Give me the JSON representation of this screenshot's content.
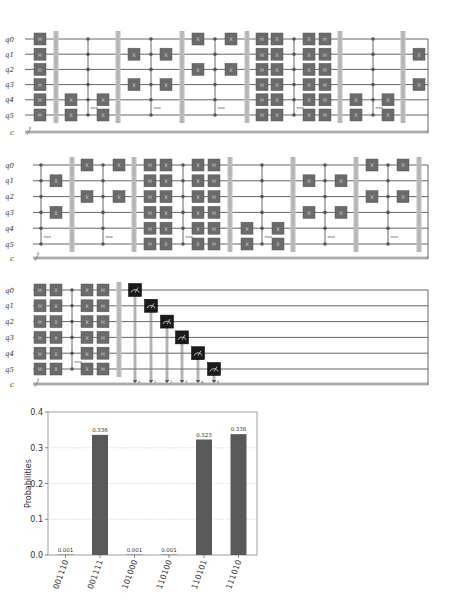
{
  "circuits": [
    {
      "id": "circuit-1",
      "wire_y": [
        39,
        54.2,
        69.4,
        84.6,
        99.8,
        115
      ],
      "c_y": 132,
      "x_start": 25,
      "x_end": 428,
      "qubit_labels": [
        "q0",
        "q1",
        "q2",
        "q3",
        "q4",
        "q5"
      ],
      "classical_label": "c",
      "classical_width": "6",
      "columns": [
        {
          "type": "gate",
          "x": 40,
          "label": "H",
          "qubits": [
            0,
            1,
            2,
            3,
            4,
            5
          ]
        },
        {
          "type": "barrier",
          "x": 56
        },
        {
          "type": "gate",
          "x": 71,
          "label": "X",
          "qubits": [
            4,
            5
          ]
        },
        {
          "type": "mcz",
          "x": 88,
          "label": "mcz"
        },
        {
          "type": "gate",
          "x": 103,
          "label": "X",
          "qubits": [
            4,
            5
          ]
        },
        {
          "type": "barrier",
          "x": 118
        },
        {
          "type": "gate",
          "x": 134,
          "label": "X",
          "qubits": [
            1,
            3
          ]
        },
        {
          "type": "mcz",
          "x": 151,
          "label": "mcz"
        },
        {
          "type": "gate",
          "x": 166,
          "label": "X",
          "qubits": [
            1,
            3
          ]
        },
        {
          "type": "barrier",
          "x": 182
        },
        {
          "type": "gate",
          "x": 198,
          "label": "X",
          "qubits": [
            0,
            2
          ]
        },
        {
          "type": "mcz",
          "x": 215,
          "label": "mcz"
        },
        {
          "type": "gate",
          "x": 231,
          "label": "X",
          "qubits": [
            0,
            2
          ]
        },
        {
          "type": "barrier",
          "x": 247
        },
        {
          "type": "gate",
          "x": 262,
          "label": "H",
          "qubits": [
            0,
            1,
            2,
            3,
            4,
            5
          ]
        },
        {
          "type": "gate",
          "x": 277,
          "label": "X",
          "qubits": [
            0,
            1,
            2,
            3,
            4,
            5
          ]
        },
        {
          "type": "mcz",
          "x": 294,
          "label": "mcz"
        },
        {
          "type": "gate",
          "x": 309,
          "label": "X",
          "qubits": [
            0,
            1,
            2,
            3,
            4,
            5
          ]
        },
        {
          "type": "gate",
          "x": 325,
          "label": "H",
          "qubits": [
            0,
            1,
            2,
            3,
            4,
            5
          ]
        },
        {
          "type": "barrier",
          "x": 340
        },
        {
          "type": "gate",
          "x": 356,
          "label": "X",
          "qubits": [
            4,
            5
          ]
        },
        {
          "type": "mcz",
          "x": 373,
          "label": "mcz"
        },
        {
          "type": "gate",
          "x": 388,
          "label": "X",
          "qubits": [
            4,
            5
          ]
        },
        {
          "type": "barrier",
          "x": 403
        },
        {
          "type": "gate",
          "x": 419,
          "label": "X",
          "qubits": [
            1,
            3
          ]
        }
      ]
    },
    {
      "id": "circuit-2",
      "wire_y": [
        165,
        180.8,
        196.6,
        212.4,
        228.2,
        244
      ],
      "c_y": 258,
      "x_start": 33,
      "x_end": 428,
      "qubit_labels": [
        "q0",
        "q1",
        "q2",
        "q3",
        "q4",
        "q5"
      ],
      "classical_label": "c",
      "classical_width": "6",
      "columns": [
        {
          "type": "mcz",
          "x": 41,
          "label": "mcz"
        },
        {
          "type": "gate",
          "x": 56,
          "label": "X",
          "qubits": [
            1,
            3
          ]
        },
        {
          "type": "barrier",
          "x": 72
        },
        {
          "type": "gate",
          "x": 87,
          "label": "X",
          "qubits": [
            0,
            2
          ]
        },
        {
          "type": "mcz",
          "x": 103,
          "label": "mcz"
        },
        {
          "type": "gate",
          "x": 119,
          "label": "X",
          "qubits": [
            0,
            2
          ]
        },
        {
          "type": "barrier",
          "x": 134
        },
        {
          "type": "gate",
          "x": 150,
          "label": "H",
          "qubits": [
            0,
            1,
            2,
            3,
            4,
            5
          ]
        },
        {
          "type": "gate",
          "x": 166,
          "label": "X",
          "qubits": [
            0,
            1,
            2,
            3,
            4,
            5
          ]
        },
        {
          "type": "mcz",
          "x": 183,
          "label": "mcz"
        },
        {
          "type": "gate",
          "x": 198,
          "label": "X",
          "qubits": [
            0,
            1,
            2,
            3,
            4,
            5
          ]
        },
        {
          "type": "gate",
          "x": 214,
          "label": "H",
          "qubits": [
            0,
            1,
            2,
            3,
            4,
            5
          ]
        },
        {
          "type": "barrier",
          "x": 230
        },
        {
          "type": "gate",
          "x": 247,
          "label": "X",
          "qubits": [
            4,
            5
          ]
        },
        {
          "type": "mcz",
          "x": 262,
          "label": "mcz"
        },
        {
          "type": "gate",
          "x": 278,
          "label": "X",
          "qubits": [
            4,
            5
          ]
        },
        {
          "type": "barrier",
          "x": 293
        },
        {
          "type": "gate",
          "x": 309,
          "label": "X",
          "qubits": [
            1,
            3
          ]
        },
        {
          "type": "mcz",
          "x": 325,
          "label": "mcz"
        },
        {
          "type": "gate",
          "x": 341,
          "label": "X",
          "qubits": [
            1,
            3
          ]
        },
        {
          "type": "barrier",
          "x": 356
        },
        {
          "type": "gate",
          "x": 372,
          "label": "X",
          "qubits": [
            0,
            2
          ]
        },
        {
          "type": "mcz",
          "x": 388,
          "label": "mcz"
        },
        {
          "type": "gate",
          "x": 403,
          "label": "X",
          "qubits": [
            0,
            2
          ]
        },
        {
          "type": "barrier",
          "x": 419
        }
      ]
    },
    {
      "id": "circuit-3",
      "wire_y": [
        290,
        305.8,
        321.6,
        337.4,
        353.2,
        369
      ],
      "c_y": 384,
      "x_start": 33,
      "x_end": 428,
      "qubit_labels": [
        "q0",
        "q1",
        "q2",
        "q3",
        "q4",
        "q5"
      ],
      "classical_label": "c",
      "classical_width": "6",
      "columns": [
        {
          "type": "gate",
          "x": 40,
          "label": "H",
          "qubits": [
            0,
            1,
            2,
            3,
            4,
            5
          ]
        },
        {
          "type": "gate",
          "x": 56,
          "label": "X",
          "qubits": [
            0,
            1,
            2,
            3,
            4,
            5
          ]
        },
        {
          "type": "mcz",
          "x": 72,
          "label": "mcz"
        },
        {
          "type": "gate",
          "x": 87,
          "label": "X",
          "qubits": [
            0,
            1,
            2,
            3,
            4,
            5
          ]
        },
        {
          "type": "gate",
          "x": 103,
          "label": "H",
          "qubits": [
            0,
            1,
            2,
            3,
            4,
            5
          ]
        },
        {
          "type": "barrier",
          "x": 119
        },
        {
          "type": "measure",
          "x": 135,
          "qubit": 0,
          "bit": "0"
        },
        {
          "type": "measure",
          "x": 151,
          "qubit": 1,
          "bit": "1"
        },
        {
          "type": "measure",
          "x": 167,
          "qubit": 2,
          "bit": "2"
        },
        {
          "type": "measure",
          "x": 182,
          "qubit": 3,
          "bit": "3"
        },
        {
          "type": "measure",
          "x": 198,
          "qubit": 4,
          "bit": "4"
        },
        {
          "type": "measure",
          "x": 214,
          "qubit": 5,
          "bit": "5"
        }
      ]
    }
  ],
  "colors": {
    "gate_fill": "#6b6b6b",
    "gate_stroke": "#555555",
    "wire": "#555555",
    "barrier": "#bdbdbd",
    "measure_fill": "#1a1a1a",
    "bar": "#595959",
    "grid": "#d9d9d9"
  },
  "chart_data": {
    "type": "bar",
    "title": "",
    "xlabel": "",
    "ylabel": "Probabilities",
    "ylim": [
      0,
      0.4
    ],
    "yticks": [
      "0.0",
      "0.1",
      "0.2",
      "0.3",
      "0.4"
    ],
    "grid": true,
    "categories": [
      "001110",
      "001111",
      "101000",
      "110100",
      "110101",
      "111010"
    ],
    "values": [
      0.001,
      0.336,
      0.001,
      0.001,
      0.323,
      0.338
    ],
    "value_labels": [
      "0.001",
      "0.336",
      "0.001",
      "0.001",
      "0.323",
      "0.338"
    ]
  },
  "chart_layout": {
    "left": 48,
    "right": 257,
    "top": 412,
    "bottom": 555,
    "centers": [
      65.5,
      100,
      134.5,
      169,
      204,
      238.5
    ],
    "bar_width": 16
  }
}
